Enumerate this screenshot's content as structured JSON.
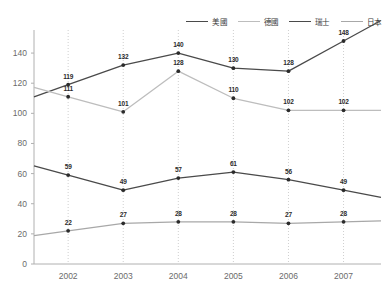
{
  "chart_data": {
    "type": "line",
    "title": "",
    "xlabel": "",
    "ylabel": "",
    "categories": [
      "2002",
      "2003",
      "2004",
      "2005",
      "2006",
      "2007"
    ],
    "ylim": [
      0,
      150
    ],
    "yticks": [
      0,
      20,
      40,
      60,
      80,
      100,
      120,
      140
    ],
    "grid": "vertical-dotted",
    "legend_position": "top-right",
    "series": [
      {
        "name": "美國",
        "color": "#4a4a4a",
        "values": [
          119,
          132,
          140,
          130,
          128,
          148
        ],
        "labels": [
          "119",
          "132",
          "140",
          "130",
          "128",
          "148"
        ]
      },
      {
        "name": "德國",
        "color": "#bdbdbd",
        "values": [
          111,
          101,
          128,
          110,
          102,
          102
        ],
        "labels": [
          "111",
          "101",
          "128",
          "110",
          "102",
          "102"
        ]
      },
      {
        "name": "瑞士",
        "color": "#4a4a4a",
        "values": [
          59,
          49,
          57,
          61,
          56,
          49
        ],
        "labels": [
          "59",
          "49",
          "57",
          "61",
          "56",
          "49"
        ]
      },
      {
        "name": "日本",
        "color": "#a8a8a8",
        "values": [
          22,
          27,
          28,
          28,
          27,
          28
        ],
        "labels": [
          "22",
          "27",
          "28",
          "28",
          "27",
          "28"
        ]
      }
    ]
  },
  "axis": {
    "y_tick_labels": [
      "0",
      "20",
      "40",
      "60",
      "80",
      "100",
      "120",
      "140"
    ],
    "x_tick_labels": [
      "2002",
      "2003",
      "2004",
      "2005",
      "2006",
      "2007"
    ]
  }
}
